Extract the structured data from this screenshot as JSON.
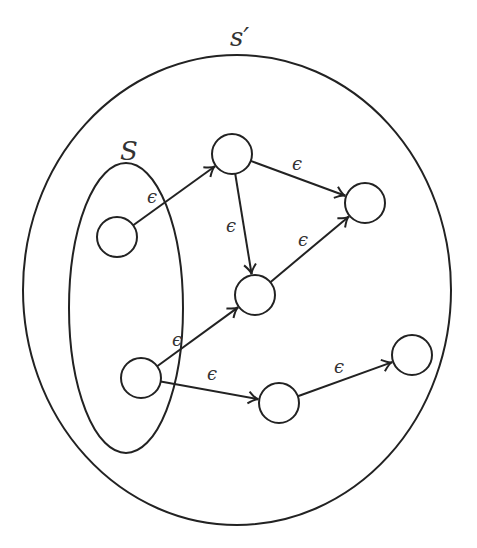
{
  "diagram": {
    "outer_set": {
      "label": "s′",
      "cx": 237,
      "cy": 290,
      "rx": 214,
      "ry": 235,
      "label_x": 230,
      "label_y": 46
    },
    "inner_set": {
      "label": "S",
      "cx": 126,
      "cy": 308,
      "rx": 57,
      "ry": 145,
      "label_x": 120,
      "label_y": 160
    },
    "node_radius": 20,
    "nodes": [
      {
        "id": "A",
        "cx": 117,
        "cy": 237
      },
      {
        "id": "B",
        "cx": 232,
        "cy": 154
      },
      {
        "id": "C",
        "cx": 365,
        "cy": 203
      },
      {
        "id": "D",
        "cx": 255,
        "cy": 295
      },
      {
        "id": "E",
        "cx": 141,
        "cy": 378
      },
      {
        "id": "F",
        "cx": 279,
        "cy": 403
      },
      {
        "id": "G",
        "cx": 412,
        "cy": 355
      }
    ],
    "edges": [
      {
        "from": "A",
        "to": "B",
        "label": "ϵ",
        "lx": 147,
        "ly": 203
      },
      {
        "from": "B",
        "to": "C",
        "label": "ϵ",
        "lx": 292,
        "ly": 170
      },
      {
        "from": "B",
        "to": "D",
        "label": "ϵ",
        "lx": 226,
        "ly": 232
      },
      {
        "from": "D",
        "to": "C",
        "label": "ϵ",
        "lx": 298,
        "ly": 246
      },
      {
        "from": "E",
        "to": "D",
        "label": "ϵ",
        "lx": 172,
        "ly": 346
      },
      {
        "from": "E",
        "to": "F",
        "label": "ϵ",
        "lx": 207,
        "ly": 380
      },
      {
        "from": "F",
        "to": "G",
        "label": "ϵ",
        "lx": 334,
        "ly": 373
      }
    ]
  }
}
